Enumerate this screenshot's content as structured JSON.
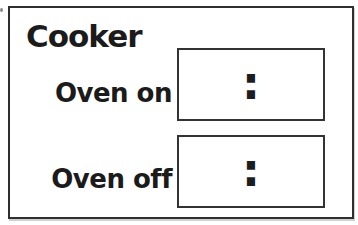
{
  "panel": {
    "title": "Cooker",
    "rows": [
      {
        "label": "Oven on",
        "value": ":"
      },
      {
        "label": "Oven off",
        "value": ":"
      }
    ]
  },
  "colors": {
    "background": "#ffffff",
    "ink": "#1d1d1d",
    "panel_border": "#2f2f2f",
    "box_border": "#333333"
  }
}
